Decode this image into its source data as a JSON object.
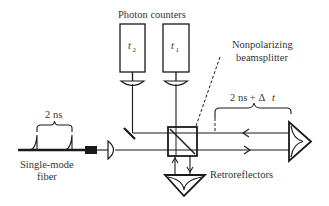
{
  "figure": {
    "type": "optical setup schematic",
    "colors": {
      "ink": "#1a1a1a",
      "text": "#333333",
      "background": "#ffffff"
    }
  },
  "labels": {
    "photon_counters": "Photon counters",
    "detector_t2_var": "t",
    "detector_t2_sub": "2",
    "detector_t1_var": "t",
    "detector_t1_sub": "1",
    "beamsplitter_line1": "Nonpolarizing",
    "beamsplitter_line2": "beamsplitter",
    "delay_label_prefix": "2 ns + Δ",
    "delay_label_var": "t",
    "pulse_separation": "2 ns",
    "fiber_line1": "Single-mode",
    "fiber_line2": "fiber",
    "retroreflectors": "Retroreflectors"
  },
  "components": [
    "photon-counter-t2",
    "photon-counter-t1",
    "nonpolarizing-beamsplitter",
    "fold-mirror",
    "fiber-connector",
    "collimating-lens",
    "retroreflector-right",
    "retroreflector-bottom"
  ]
}
